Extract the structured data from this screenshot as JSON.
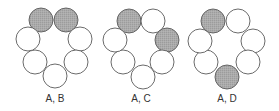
{
  "colors": {
    "filled": "#a9a9a9",
    "empty": "#ffffff",
    "stroke": "#5a5a5a",
    "text": "#333333"
  },
  "ring_positions": [
    "top-left",
    "top-right",
    "right",
    "lower-right",
    "bottom",
    "lower-left",
    "left"
  ],
  "groups": [
    {
      "label": "A, B",
      "filled_positions": [
        "top-left",
        "top-right"
      ],
      "circles": [
        {
          "pos": "top-left",
          "cx": 41,
          "cy": 20,
          "filled": true
        },
        {
          "pos": "top-right",
          "cx": 66,
          "cy": 20,
          "filled": true
        },
        {
          "pos": "right",
          "cx": 80,
          "cy": 39,
          "filled": false
        },
        {
          "pos": "lower-right",
          "cx": 76,
          "cy": 62,
          "filled": false
        },
        {
          "pos": "bottom",
          "cx": 55,
          "cy": 76,
          "filled": false
        },
        {
          "pos": "lower-left",
          "cx": 35,
          "cy": 62,
          "filled": false
        },
        {
          "pos": "left",
          "cx": 28,
          "cy": 39,
          "filled": false
        }
      ],
      "label_x": 55
    },
    {
      "label": "A, C",
      "filled_positions": [
        "top-left",
        "right"
      ],
      "circles": [
        {
          "pos": "top-left",
          "cx": 129,
          "cy": 21,
          "filled": true
        },
        {
          "pos": "top-right",
          "cx": 153,
          "cy": 21,
          "filled": false
        },
        {
          "pos": "right",
          "cx": 167,
          "cy": 40,
          "filled": true
        },
        {
          "pos": "lower-right",
          "cx": 162,
          "cy": 62,
          "filled": false
        },
        {
          "pos": "bottom",
          "cx": 143,
          "cy": 77,
          "filled": false
        },
        {
          "pos": "lower-left",
          "cx": 123,
          "cy": 62,
          "filled": false
        },
        {
          "pos": "left",
          "cx": 115,
          "cy": 40,
          "filled": false
        }
      ],
      "label_x": 141
    },
    {
      "label": "A, D",
      "filled_positions": [
        "top-left",
        "bottom"
      ],
      "circles": [
        {
          "pos": "top-left",
          "cx": 213,
          "cy": 21,
          "filled": true
        },
        {
          "pos": "top-right",
          "cx": 238,
          "cy": 21,
          "filled": false
        },
        {
          "pos": "right",
          "cx": 253,
          "cy": 41,
          "filled": false
        },
        {
          "pos": "lower-right",
          "cx": 248,
          "cy": 62,
          "filled": false
        },
        {
          "pos": "bottom",
          "cx": 227,
          "cy": 77,
          "filled": true
        },
        {
          "pos": "lower-left",
          "cx": 206,
          "cy": 62,
          "filled": false
        },
        {
          "pos": "left",
          "cx": 200,
          "cy": 41,
          "filled": false
        }
      ],
      "label_x": 227
    }
  ],
  "circle_radius": 12,
  "label_y": 102
}
